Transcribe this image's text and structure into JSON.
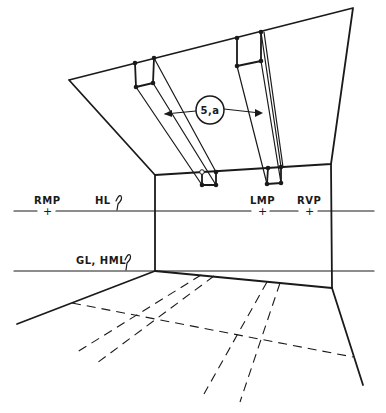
{
  "diagram": {
    "type": "two-point perspective interior sketch",
    "labels": {
      "rmp": "RMP",
      "hl": "HL",
      "lmp": "LMP",
      "rvp": "RVP",
      "gl_hml": "GL, HML",
      "callout": "5,a"
    },
    "markers": {
      "plus": "+",
      "hook": "?"
    },
    "colors": {
      "ink": "#1a1a1a",
      "paper": "#ffffff"
    }
  }
}
